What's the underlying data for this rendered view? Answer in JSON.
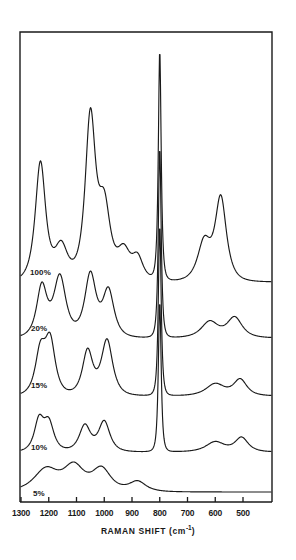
{
  "figure": {
    "domain": "chart",
    "background_color": "#ffffff",
    "line_color": "#1a1a1a",
    "frame": {
      "left": 20,
      "right": 272,
      "top": 32,
      "bottom": 502
    }
  },
  "axis": {
    "x_title_main": "RAMAN SHIFT (cm",
    "x_title_exp": "-1",
    "x_title_close": ")",
    "x_title_full": "RAMAN SHIFT (cm-1)",
    "tick_labels": [
      "1300",
      "1200",
      "1100",
      "1000",
      "900",
      "800",
      "700",
      "600",
      "500"
    ],
    "tick_values": [
      1300,
      1200,
      1100,
      1000,
      900,
      800,
      700,
      600,
      500
    ]
  },
  "trace_labels": [
    {
      "text": "100%",
      "x": 30,
      "y": 268
    },
    {
      "text": "20%",
      "x": 31,
      "y": 324
    },
    {
      "text": "15%",
      "x": 31,
      "y": 381
    },
    {
      "text": "10%",
      "x": 31,
      "y": 443
    },
    {
      "text": "5%",
      "x": 33,
      "y": 489
    }
  ],
  "chart_data": {
    "type": "line",
    "title": "",
    "xlabel": "RAMAN SHIFT (cm-1)",
    "ylabel": "",
    "xlim": [
      1350,
      460
    ],
    "x_inverted": true,
    "grid": false,
    "legend": "inline-left-labels",
    "tick_labels": [
      "1300",
      "1200",
      "1100",
      "1000",
      "900",
      "800",
      "700",
      "600",
      "500"
    ],
    "series": [
      {
        "name": "100%",
        "label": "100%",
        "baseline_y": 282,
        "peaks": [
          {
            "shift": 1230,
            "height": 118,
            "width": 11,
            "note": "strong"
          },
          {
            "shift": 1155,
            "height": 34,
            "width": 14
          },
          {
            "shift": 1050,
            "height": 160,
            "width": 11,
            "note": "very strong"
          },
          {
            "shift": 1000,
            "height": 70,
            "width": 13
          },
          {
            "shift": 930,
            "height": 28,
            "width": 14
          },
          {
            "shift": 880,
            "height": 22,
            "width": 12
          },
          {
            "shift": 800,
            "height": 230,
            "width": 3,
            "note": "sharp dominant"
          },
          {
            "shift": 640,
            "height": 38,
            "width": 14
          },
          {
            "shift": 580,
            "height": 82,
            "width": 12
          }
        ]
      },
      {
        "name": "20%",
        "label": "20%",
        "baseline_y": 338,
        "peaks": [
          {
            "shift": 1225,
            "height": 50,
            "width": 11
          },
          {
            "shift": 1160,
            "height": 60,
            "width": 13
          },
          {
            "shift": 1050,
            "height": 62,
            "width": 12
          },
          {
            "shift": 985,
            "height": 46,
            "width": 12
          },
          {
            "shift": 800,
            "height": 190,
            "width": 3,
            "note": "sharp dominant"
          },
          {
            "shift": 620,
            "height": 16,
            "width": 18
          },
          {
            "shift": 530,
            "height": 20,
            "width": 16
          }
        ]
      },
      {
        "name": "15%",
        "label": "15%",
        "baseline_y": 396,
        "peaks": [
          {
            "shift": 1230,
            "height": 42,
            "width": 11
          },
          {
            "shift": 1195,
            "height": 52,
            "width": 11
          },
          {
            "shift": 1060,
            "height": 44,
            "width": 11
          },
          {
            "shift": 990,
            "height": 55,
            "width": 12
          },
          {
            "shift": 800,
            "height": 170,
            "width": 3,
            "note": "sharp dominant"
          },
          {
            "shift": 600,
            "height": 12,
            "width": 20
          },
          {
            "shift": 510,
            "height": 16,
            "width": 14
          }
        ]
      },
      {
        "name": "10%",
        "label": "10%",
        "baseline_y": 452,
        "peaks": [
          {
            "shift": 1235,
            "height": 30,
            "width": 10
          },
          {
            "shift": 1200,
            "height": 28,
            "width": 11
          },
          {
            "shift": 1070,
            "height": 26,
            "width": 12
          },
          {
            "shift": 1000,
            "height": 30,
            "width": 12
          },
          {
            "shift": 800,
            "height": 150,
            "width": 3,
            "note": "sharp dominant"
          },
          {
            "shift": 600,
            "height": 10,
            "width": 20
          },
          {
            "shift": 505,
            "height": 14,
            "width": 14
          }
        ]
      },
      {
        "name": "5%",
        "label": "5%",
        "baseline_y": 492,
        "peaks": [
          {
            "shift": 1210,
            "height": 22,
            "width": 26,
            "note": "broad shoulder"
          },
          {
            "shift": 1110,
            "height": 24,
            "width": 22
          },
          {
            "shift": 1010,
            "height": 22,
            "width": 20
          },
          {
            "shift": 880,
            "height": 10,
            "width": 18
          }
        ]
      }
    ]
  }
}
